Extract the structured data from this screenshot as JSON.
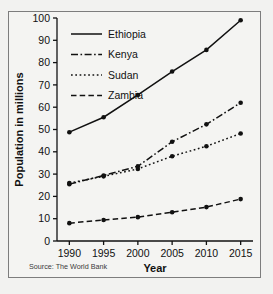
{
  "top_caption": "",
  "figure": {
    "source_note": "Source: The World Bank",
    "x_axis_title": "Year",
    "y_axis_title": "Population in millions"
  },
  "chart_data": {
    "type": "line",
    "title": "",
    "subtitle": "",
    "xlabel": "Year",
    "ylabel": "Population in millions",
    "x": [
      1990,
      1995,
      2000,
      2005,
      2010,
      2015
    ],
    "xtick_labels": [
      "1990",
      "1995",
      "2000",
      "2005",
      "2010",
      "2015"
    ],
    "ytick_labels": [
      "0",
      "10",
      "20",
      "30",
      "40",
      "50",
      "60",
      "70",
      "80",
      "90",
      "100"
    ],
    "yticks": [
      0,
      10,
      20,
      30,
      40,
      50,
      60,
      70,
      80,
      90,
      100
    ],
    "xlim": [
      1988.2,
      2016.8
    ],
    "ylim": [
      0,
      100
    ],
    "grid": false,
    "legend_position": "top-left",
    "marker": "filled-circle",
    "line_color": "#111111",
    "series": [
      {
        "name": "Ethiopia",
        "dash": "solid",
        "dasharray": "none",
        "values": [
          48.8,
          55.5,
          65.5,
          76.0,
          85.7,
          99.0
        ]
      },
      {
        "name": "Kenya",
        "dash": "dash-dot",
        "dasharray": "7,2.5,1.6,2.5",
        "values": [
          25.5,
          29.4,
          33.5,
          44.5,
          52.3,
          62.0
        ]
      },
      {
        "name": "Sudan",
        "dash": "dotted",
        "dasharray": "1.7,2.6",
        "values": [
          26.0,
          29.0,
          32.3,
          38.0,
          42.5,
          48.2
        ]
      },
      {
        "name": "Zambia",
        "dash": "dashed",
        "dasharray": "5.5,3.2",
        "values": [
          8.0,
          9.4,
          10.7,
          12.9,
          15.2,
          18.8
        ]
      }
    ],
    "annotations": [
      "Source: The World Bank"
    ]
  }
}
